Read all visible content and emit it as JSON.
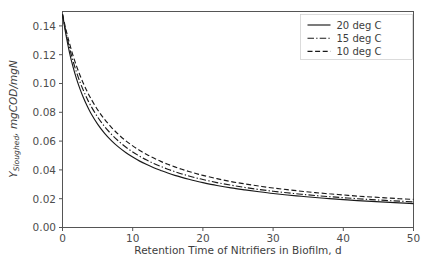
{
  "chart_data": {
    "type": "line",
    "title": "",
    "xlabel": "Retention Time of Nitrifiers in Biofilm, d",
    "ylabel_main": "Y",
    "ylabel_sub": "Sloughed",
    "ylabel_rest": ", mgCOD/mgN",
    "ylabel_full": "Y_Sloughed, mgCOD/mgN",
    "xlim": [
      0,
      50
    ],
    "ylim": [
      0.0,
      0.15
    ],
    "xticks": [
      0,
      10,
      20,
      30,
      40,
      50
    ],
    "xtick_labels": [
      "0",
      "10",
      "20",
      "30",
      "40",
      "50"
    ],
    "yticks": [
      0.0,
      0.02,
      0.04,
      0.06,
      0.08,
      0.1,
      0.12,
      0.14
    ],
    "ytick_labels": [
      "0.00",
      "0.02",
      "0.04",
      "0.06",
      "0.08",
      "0.10",
      "0.12",
      "0.14"
    ],
    "grid": false,
    "legend_position": "upper right",
    "line_color": "#1a1a1a",
    "series": [
      {
        "name": "20 deg C",
        "dash": "solid",
        "dasharray": "",
        "x": [
          0,
          0.5,
          1,
          1.5,
          2,
          2.5,
          3,
          3.5,
          4,
          5,
          6,
          7,
          8,
          9,
          10,
          11,
          12,
          13,
          14,
          15,
          16,
          17,
          18,
          19,
          20,
          22,
          24,
          26,
          28,
          30,
          32,
          34,
          36,
          38,
          40,
          42,
          44,
          46,
          48,
          50
        ],
        "y": [
          0.148,
          0.1335,
          0.1215,
          0.1115,
          0.1032,
          0.0961,
          0.0899,
          0.0845,
          0.0797,
          0.0718,
          0.0654,
          0.0602,
          0.0558,
          0.0521,
          0.0489,
          0.0461,
          0.0437,
          0.0415,
          0.0396,
          0.0378,
          0.0362,
          0.0348,
          0.0335,
          0.0323,
          0.0312,
          0.0292,
          0.0275,
          0.0261,
          0.0248,
          0.0236,
          0.0226,
          0.0217,
          0.0208,
          0.0201,
          0.0194,
          0.0187,
          0.0181,
          0.0176,
          0.0171,
          0.0166
        ]
      },
      {
        "name": "15 deg C",
        "dash": "dashdot",
        "dasharray": "6.5,2.2,1.3,2.2",
        "x": [
          0,
          0.5,
          1,
          1.5,
          2,
          2.5,
          3,
          3.5,
          4,
          5,
          6,
          7,
          8,
          9,
          10,
          11,
          12,
          13,
          14,
          15,
          16,
          17,
          18,
          19,
          20,
          22,
          24,
          26,
          28,
          30,
          32,
          34,
          36,
          38,
          40,
          42,
          44,
          46,
          48,
          50
        ],
        "y": [
          0.148,
          0.1355,
          0.1248,
          0.1156,
          0.1078,
          0.1009,
          0.0949,
          0.0895,
          0.0848,
          0.0767,
          0.0701,
          0.0646,
          0.0599,
          0.0559,
          0.0525,
          0.0495,
          0.0468,
          0.0445,
          0.0424,
          0.0405,
          0.0388,
          0.0372,
          0.0358,
          0.0345,
          0.0333,
          0.0312,
          0.0294,
          0.0278,
          0.0264,
          0.0252,
          0.0241,
          0.0231,
          0.0222,
          0.0214,
          0.0207,
          0.02,
          0.0194,
          0.0188,
          0.0183,
          0.0178
        ]
      },
      {
        "name": "10 deg C",
        "dash": "dashed",
        "dasharray": "5.0,2.6",
        "x": [
          0,
          0.5,
          1,
          1.5,
          2,
          2.5,
          3,
          3.5,
          4,
          5,
          6,
          7,
          8,
          9,
          10,
          11,
          12,
          13,
          14,
          15,
          16,
          17,
          18,
          19,
          20,
          22,
          24,
          26,
          28,
          30,
          32,
          34,
          36,
          38,
          40,
          42,
          44,
          46,
          48,
          50
        ],
        "y": [
          0.148,
          0.1372,
          0.1278,
          0.1194,
          0.1121,
          0.1056,
          0.0998,
          0.0946,
          0.0899,
          0.0818,
          0.0751,
          0.0694,
          0.0645,
          0.0603,
          0.0567,
          0.0535,
          0.0507,
          0.0482,
          0.0459,
          0.0439,
          0.0421,
          0.0404,
          0.0389,
          0.0375,
          0.0362,
          0.0339,
          0.0319,
          0.0303,
          0.0288,
          0.0274,
          0.0263,
          0.0252,
          0.0242,
          0.0234,
          0.0226,
          0.0218,
          0.0212,
          0.0206,
          0.02,
          0.0195
        ]
      }
    ]
  }
}
